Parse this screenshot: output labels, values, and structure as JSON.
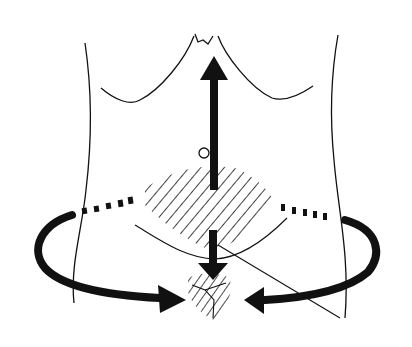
{
  "figure": {
    "title": "Abdominal torso diagram with radiating arrows",
    "background": "#ffffff",
    "ink": "#111111",
    "elements": {
      "torso_outline": "torso-outline",
      "costal_margin": "rib-margin-line",
      "navel": "umbilicus-circle",
      "upper_hatched_region": "diamond-hatched-area",
      "lower_hatched_region": "small-hatched-area",
      "arrows": [
        {
          "name": "up-arrow",
          "direction": "up"
        },
        {
          "name": "down-arrow",
          "direction": "down"
        },
        {
          "name": "left-curved-arrow",
          "direction": "inward-from-left"
        },
        {
          "name": "right-curved-arrow",
          "direction": "inward-from-right"
        }
      ],
      "dashed_girdle": "dashed-waist-line"
    }
  }
}
